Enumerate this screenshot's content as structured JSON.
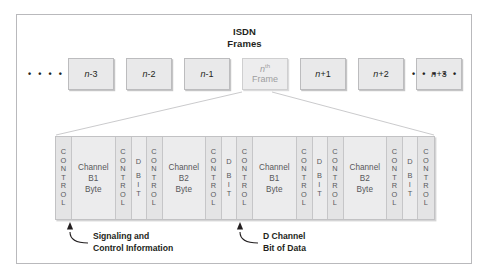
{
  "figure": {
    "title_line1": "ISDN",
    "title_line2": "Frames"
  },
  "frame_row": {
    "ellipsis_left": "• • • • •",
    "ellipsis_right": "• • • • •",
    "frames": [
      {
        "name": "frame-n-minus-3",
        "label": "n-3",
        "italic_part": "n",
        "rest": "-3",
        "highlight": false
      },
      {
        "name": "frame-n-minus-2",
        "label": "n-2",
        "italic_part": "n",
        "rest": "-2",
        "highlight": false
      },
      {
        "name": "frame-n-minus-1",
        "label": "n-1",
        "italic_part": "n",
        "rest": "-1",
        "highlight": false
      },
      {
        "name": "frame-nth",
        "label": "nth Frame",
        "italic_part": "n",
        "rest": "th",
        "line2": "Frame",
        "highlight": true
      },
      {
        "name": "frame-n-plus-1",
        "label": "n+1",
        "italic_part": "n",
        "rest": "+1",
        "highlight": false
      },
      {
        "name": "frame-n-plus-2",
        "label": "n+2",
        "italic_part": "n",
        "rest": "+2",
        "highlight": false
      },
      {
        "name": "frame-n-plus-3",
        "label": "n+3",
        "italic_part": "n",
        "rest": "+3",
        "highlight": false
      }
    ]
  },
  "strip": {
    "cells": [
      {
        "type": "control",
        "label": "CONTROL"
      },
      {
        "type": "byte",
        "line1": "Channel",
        "line2": "B1",
        "line3": "Byte"
      },
      {
        "type": "control",
        "label": "CONTROL"
      },
      {
        "type": "dbit",
        "top": "D",
        "bottom": "BIT"
      },
      {
        "type": "control",
        "label": "CONTROL"
      },
      {
        "type": "byte",
        "line1": "Channel",
        "line2": "B2",
        "line3": "Byte"
      },
      {
        "type": "control",
        "label": "CONTROL"
      },
      {
        "type": "dbit",
        "top": "D",
        "bottom": "BIT"
      },
      {
        "type": "control",
        "label": "CONTROL"
      },
      {
        "type": "byte",
        "line1": "Channel",
        "line2": "B1",
        "line3": "Byte"
      },
      {
        "type": "control",
        "label": "CONTROL"
      },
      {
        "type": "dbit",
        "top": "D",
        "bottom": "BIT"
      },
      {
        "type": "control",
        "label": "CONTROL"
      },
      {
        "type": "byte",
        "line1": "Channel",
        "line2": "B2",
        "line3": "Byte"
      },
      {
        "type": "control",
        "label": "CONTROL"
      },
      {
        "type": "dbit",
        "top": "D",
        "bottom": "BIT"
      },
      {
        "type": "control",
        "label": "CONTROL"
      }
    ]
  },
  "annotations": {
    "signaling_line1": "Signaling and",
    "signaling_line2": "Control Information",
    "dchannel_line1": "D Channel",
    "dchannel_line2": "Bit of Data"
  },
  "colors": {
    "outer_border": "#b9b9bc",
    "frame_fill": "#e9e9ea",
    "frame_border": "#bcbcbe",
    "nth_frame_text": "#9d9da0",
    "strip_fill": "#ececed",
    "control_fill": "#e4e4e5",
    "cell_divider": "#c6c6c8",
    "text": "#231f20",
    "cell_text": "#58585b"
  }
}
